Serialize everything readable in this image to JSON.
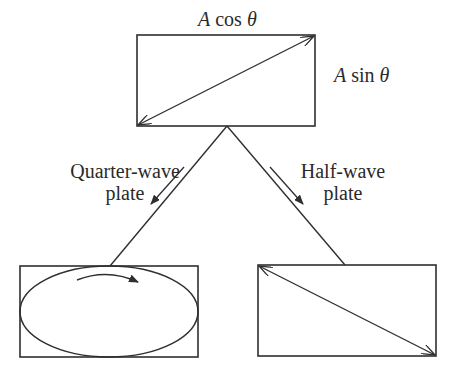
{
  "colors": {
    "stroke": "#2f2f2f",
    "text": "#2a2a2a",
    "background": "#ffffff"
  },
  "top_box": {
    "x": 137,
    "y": 35,
    "w": 178,
    "h": 91,
    "label_top": {
      "var": "A",
      "fn": "cos",
      "angle": "θ"
    },
    "label_right": {
      "var": "A",
      "fn": "sin",
      "angle": "θ"
    },
    "vector": {
      "from": [
        138,
        125
      ],
      "to": [
        314,
        36
      ],
      "double_headed": true
    }
  },
  "apex": [
    227,
    126
  ],
  "branches": [
    {
      "id": "quarter-wave",
      "label_line1": "Quarter-wave",
      "label_line2": "plate",
      "line": {
        "from": [
          227,
          126
        ],
        "to": [
          110,
          266
        ]
      },
      "direction_arrow": {
        "from": [
          184,
          167
        ],
        "to": [
          151,
          204
        ]
      }
    },
    {
      "id": "half-wave",
      "label_line1": "Half-wave",
      "label_line2": "plate",
      "line": {
        "from": [
          227,
          126
        ],
        "to": [
          345,
          265
        ]
      },
      "direction_arrow": {
        "from": [
          270,
          167
        ],
        "to": [
          303,
          204
        ]
      }
    }
  ],
  "bottom_left_box": {
    "x": 20,
    "y": 266,
    "w": 178,
    "h": 91,
    "shape": "ellipse",
    "rotation_arrow": {
      "from": [
        77,
        280
      ],
      "to": [
        138,
        282
      ],
      "sense": "clockwise"
    }
  },
  "bottom_right_box": {
    "x": 258,
    "y": 265,
    "w": 178,
    "h": 91,
    "vector": {
      "from": [
        259,
        266
      ],
      "to": [
        435,
        355
      ],
      "double_headed": true
    }
  }
}
